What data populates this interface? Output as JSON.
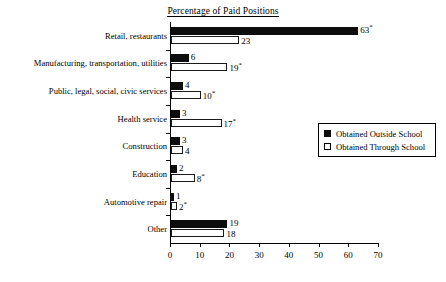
{
  "chart_data": {
    "type": "bar",
    "orientation": "horizontal",
    "title": "Percentage of Paid Positions",
    "xlabel": "",
    "ylabel": "",
    "xlim": [
      0,
      70
    ],
    "xticks": [
      0,
      10,
      20,
      30,
      40,
      50,
      60,
      70
    ],
    "grid": false,
    "legend_position": "right",
    "categories": [
      "Retail, restaurants",
      "Manufacturing, transportation, utilities",
      "Public, legal, social, civic services",
      "Health service",
      "Construction",
      "Education",
      "Automotive repair",
      "Other"
    ],
    "series": [
      {
        "name": "Obtained Outside School",
        "values": [
          63,
          6,
          4,
          3,
          3,
          2,
          1,
          19
        ],
        "labels": [
          "63*",
          "6",
          "4",
          "3",
          "3",
          "2",
          "1",
          "19"
        ],
        "style": "filled",
        "color": "#0d0d0d"
      },
      {
        "name": "Obtained Through School",
        "values": [
          23,
          19,
          10,
          17,
          4,
          8,
          2,
          18
        ],
        "labels": [
          "23",
          "19*",
          "10*",
          "17*",
          "4",
          "8*",
          "2*",
          "18"
        ],
        "style": "open",
        "color": "#ffffff"
      }
    ],
    "annotations": {
      "asterisk_note": "*"
    }
  },
  "legend": {
    "items": [
      {
        "label": "Obtained Outside School",
        "swatch": "filled-square"
      },
      {
        "label": "Obtained Through School",
        "swatch": "open-square"
      }
    ]
  },
  "axis": {
    "tick_labels": [
      "0",
      "10",
      "20",
      "30",
      "40",
      "50",
      "60",
      "70"
    ]
  }
}
